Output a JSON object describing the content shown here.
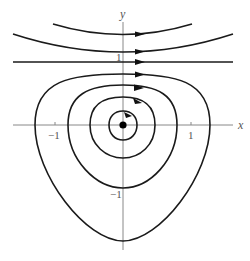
{
  "diagram": {
    "type": "phase-portrait",
    "axes": {
      "x_label": "x",
      "y_label": "y",
      "tick_labels": {
        "x_neg": "−1",
        "x_pos": "1",
        "y_pos": "1",
        "y_neg": "−1"
      }
    },
    "equilibrium": {
      "label": "center",
      "x": 0,
      "y": 0
    },
    "trajectories": {
      "open_above": [
        {
          "name": "top-open-orbit",
          "y_at_axis": 1.35,
          "direction": "right"
        },
        {
          "name": "second-open-orbit",
          "y_at_axis": 1.1,
          "direction": "right"
        }
      ],
      "separatrix": {
        "name": "line-y-equals-1",
        "y": 1,
        "direction": "right"
      },
      "closed_orbits": [
        {
          "name": "orbit-1",
          "x_min": -0.2,
          "x_max": 0.2,
          "y_min": -0.2,
          "y_max": 0.2,
          "direction": "clockwise"
        },
        {
          "name": "orbit-2",
          "x_min": -0.5,
          "x_max": 0.47,
          "y_min": -0.5,
          "y_max": 0.4,
          "direction": "clockwise"
        },
        {
          "name": "orbit-3",
          "x_min": -0.8,
          "x_max": 0.8,
          "y_min": -0.93,
          "y_max": 0.58,
          "direction": "clockwise"
        },
        {
          "name": "orbit-4",
          "x_min": -1.3,
          "x_max": 1.3,
          "y_min": -1.7,
          "y_max": 0.75,
          "direction": "clockwise"
        }
      ]
    }
  }
}
